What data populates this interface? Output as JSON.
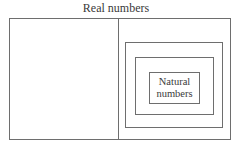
{
  "diagram": {
    "title": "Real numbers",
    "regions": [
      {
        "name": "real-numbers",
        "label": "Real numbers"
      },
      {
        "name": "left-region",
        "label": ""
      },
      {
        "name": "right-region",
        "label": ""
      },
      {
        "name": "nested-set-1",
        "label": ""
      },
      {
        "name": "nested-set-2",
        "label": ""
      },
      {
        "name": "natural-numbers",
        "label_line1": "Natural",
        "label_line2": "numbers"
      }
    ],
    "colors": {
      "line": "#6e6e6e",
      "text": "#3a3a3a",
      "background": "#ffffff"
    }
  }
}
